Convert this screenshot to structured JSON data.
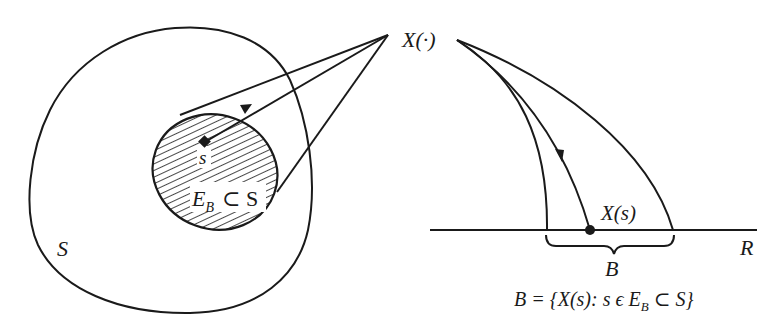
{
  "figure": {
    "labels": {
      "sample_space": "S",
      "event": "E",
      "event_subscript": "B",
      "event_relation": "⊂ S",
      "sample_point": "s",
      "random_variable": "X(·)",
      "image_point": "X(s)",
      "real_line": "R",
      "borel_set": "B"
    },
    "formula": {
      "lhs": "B = {X(s): s ϵ E",
      "subscript": "B",
      "rhs": " ⊂ S}"
    },
    "colors": {
      "ink": "#1a1a1a",
      "background": "#ffffff"
    }
  }
}
